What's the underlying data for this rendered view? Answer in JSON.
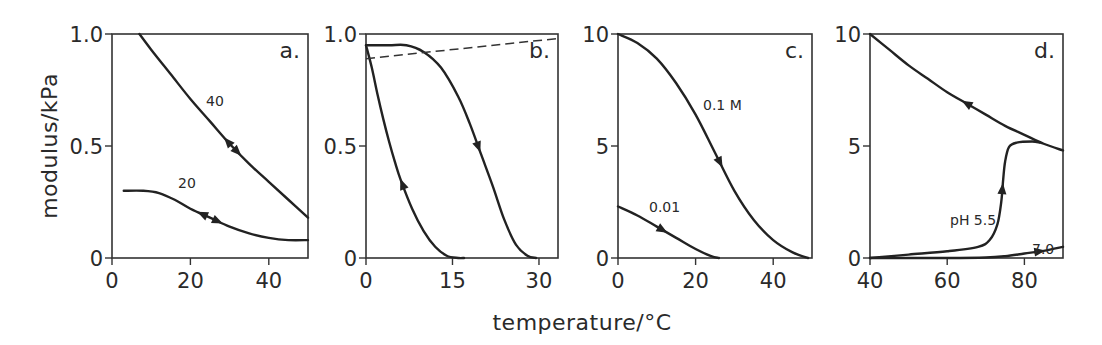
{
  "figure": {
    "ylabel": "modulus/kPa",
    "xlabel": "temperature/°C"
  },
  "chart_data": [
    {
      "type": "line",
      "panel": "a.",
      "xlim": [
        0,
        50
      ],
      "ylim": [
        0,
        1.0
      ],
      "xticks": [
        0,
        20,
        40
      ],
      "xtick_labels": [
        "0",
        "20",
        "40"
      ],
      "yticks": [
        0,
        0.5,
        1.0
      ],
      "ytick_labels": [
        "0",
        "0.5",
        "1.0"
      ],
      "grid": false,
      "series": [
        {
          "name": "40",
          "label": "40",
          "x": [
            7,
            10,
            15,
            20,
            25,
            30,
            35,
            40,
            45,
            50
          ],
          "y": [
            1.0,
            0.93,
            0.82,
            0.71,
            0.61,
            0.51,
            0.42,
            0.34,
            0.26,
            0.18
          ],
          "arrows": [
            {
              "x": 29.5,
              "dir": "back"
            },
            {
              "x": 32,
              "dir": "forward"
            }
          ]
        },
        {
          "name": "20",
          "label": "20",
          "x": [
            3,
            8,
            12,
            16,
            20,
            25,
            30,
            35,
            40,
            45,
            50
          ],
          "y": [
            0.3,
            0.3,
            0.29,
            0.26,
            0.22,
            0.18,
            0.14,
            0.11,
            0.09,
            0.08,
            0.08
          ],
          "arrows": [
            {
              "x": 23,
              "dir": "back"
            },
            {
              "x": 27,
              "dir": "forward"
            }
          ]
        }
      ]
    },
    {
      "type": "line",
      "panel": "b.",
      "xlim": [
        0,
        33.3
      ],
      "ylim": [
        0,
        1.0
      ],
      "xticks": [
        0,
        15,
        30
      ],
      "xtick_labels": [
        "0",
        "15",
        "30"
      ],
      "yticks": [
        0,
        0.5,
        1.0
      ],
      "ytick_labels": [
        "0",
        "0.5",
        "1.0"
      ],
      "grid": false,
      "series": [
        {
          "name": "cooling",
          "x": [
            0,
            4,
            7,
            10,
            13,
            16,
            18,
            20,
            22,
            24,
            26,
            28,
            29.5
          ],
          "y": [
            0.95,
            0.95,
            0.95,
            0.92,
            0.85,
            0.72,
            0.6,
            0.46,
            0.32,
            0.17,
            0.06,
            0.01,
            0
          ],
          "arrows": [
            {
              "x": 19.5,
              "dir": "forward"
            }
          ]
        },
        {
          "name": "heating",
          "x": [
            0,
            1,
            2,
            3,
            4,
            5,
            6,
            8,
            10,
            12,
            14,
            16,
            17
          ],
          "y": [
            0.95,
            0.85,
            0.73,
            0.62,
            0.52,
            0.43,
            0.35,
            0.22,
            0.12,
            0.05,
            0.01,
            0,
            0
          ],
          "arrows": [
            {
              "x": 6.3,
              "dir": "back"
            }
          ]
        },
        {
          "name": "reference",
          "style": "dashed",
          "x": [
            0,
            33.3
          ],
          "y": [
            0.89,
            0.98
          ]
        }
      ]
    },
    {
      "type": "line",
      "panel": "c.",
      "xlim": [
        0,
        50
      ],
      "ylim": [
        0,
        10
      ],
      "xticks": [
        0,
        20,
        40
      ],
      "xtick_labels": [
        "0",
        "20",
        "40"
      ],
      "yticks": [
        0,
        5,
        10
      ],
      "ytick_labels": [
        "0",
        "5",
        "10"
      ],
      "grid": false,
      "series": [
        {
          "name": "0.1 M",
          "label": "0.1 M",
          "x": [
            0,
            5,
            10,
            15,
            20,
            25,
            30,
            35,
            40,
            45,
            49
          ],
          "y": [
            10,
            9.6,
            8.9,
            7.8,
            6.4,
            4.7,
            3.0,
            1.7,
            0.8,
            0.25,
            0
          ],
          "arrows": [
            {
              "x": 26.3,
              "dir": "forward"
            }
          ]
        },
        {
          "name": "0.01",
          "label": "0.01",
          "x": [
            0,
            5,
            10,
            15,
            20,
            24,
            26
          ],
          "y": [
            2.3,
            1.9,
            1.4,
            0.9,
            0.4,
            0.08,
            0
          ],
          "arrows": [
            {
              "x": 11.5,
              "dir": "forward"
            }
          ]
        }
      ]
    },
    {
      "type": "line",
      "panel": "d.",
      "xlim": [
        40,
        90
      ],
      "ylim": [
        0,
        10
      ],
      "xticks": [
        40,
        60,
        80
      ],
      "xtick_labels": [
        "40",
        "60",
        "80"
      ],
      "yticks": [
        0,
        5,
        10
      ],
      "ytick_labels": [
        "0",
        "5",
        "10"
      ],
      "grid": false,
      "series": [
        {
          "name": "cooling",
          "x": [
            40,
            45,
            50,
            55,
            60,
            65,
            70,
            75,
            80,
            85,
            90
          ],
          "y": [
            10,
            9.3,
            8.6,
            8.0,
            7.4,
            6.9,
            6.4,
            5.9,
            5.5,
            5.1,
            4.8
          ],
          "arrows": [
            {
              "x": 65,
              "dir": "back"
            }
          ]
        },
        {
          "name": "pH 5.5",
          "label": "pH 5.5",
          "x": [
            40,
            50,
            60,
            68,
            71,
            73,
            74,
            74.5,
            75,
            76,
            78,
            82,
            84
          ],
          "y": [
            0,
            0.15,
            0.3,
            0.5,
            0.8,
            1.5,
            2.5,
            3.5,
            4.3,
            4.95,
            5.15,
            5.2,
            5.15
          ],
          "arrows": [
            {
              "x": 74.3,
              "dir": "forward"
            }
          ]
        },
        {
          "name": "7.0",
          "label": "7.0",
          "x": [
            40,
            60,
            70,
            75,
            80,
            85,
            90
          ],
          "y": [
            0,
            0,
            0.02,
            0.08,
            0.2,
            0.32,
            0.5
          ],
          "arrows": [
            {
              "x": 84,
              "dir": "forward"
            }
          ]
        }
      ]
    }
  ]
}
